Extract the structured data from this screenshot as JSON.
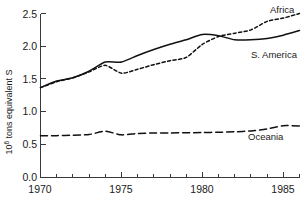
{
  "chart_data": {
    "type": "line",
    "title": "",
    "xlabel": "",
    "ylabel": "10⁶ tons equivalent S",
    "ylabel_base": "10",
    "ylabel_exp": "6",
    "ylabel_rest": " tons equivalent S",
    "xlim": [
      1970,
      1986
    ],
    "ylim": [
      0.0,
      2.5
    ],
    "grid": false,
    "legend_position": "right-inline",
    "x_ticks_major": [
      1970,
      1975,
      1980,
      1985
    ],
    "x_tick_labels": [
      "1970",
      "1975",
      "1980",
      "1985"
    ],
    "x_ticks_minor": [
      1971,
      1972,
      1973,
      1974,
      1976,
      1977,
      1978,
      1979,
      1981,
      1982,
      1983,
      1984,
      1986
    ],
    "y_ticks": [
      0.0,
      0.5,
      1.0,
      1.5,
      2.0,
      2.5
    ],
    "y_tick_labels": [
      "0.0",
      "0.5",
      "1.0",
      "1.5",
      "2.0",
      "2.5"
    ],
    "x": [
      1970,
      1971,
      1972,
      1973,
      1974,
      1975,
      1976,
      1977,
      1978,
      1979,
      1980,
      1981,
      1982,
      1983,
      1984,
      1985,
      1986
    ],
    "series": [
      {
        "name": "S. America",
        "style": "solid",
        "color": "#111111",
        "label": "S. America",
        "values": [
          1.37,
          1.47,
          1.52,
          1.62,
          1.76,
          1.76,
          1.86,
          1.95,
          2.03,
          2.1,
          2.18,
          2.16,
          2.1,
          2.1,
          2.12,
          2.17,
          2.24
        ]
      },
      {
        "name": "Africa",
        "style": "dotted",
        "color": "#111111",
        "label": "Africa",
        "values": [
          1.37,
          1.46,
          1.52,
          1.61,
          1.71,
          1.59,
          1.65,
          1.72,
          1.78,
          1.83,
          2.03,
          2.15,
          2.2,
          2.25,
          2.38,
          2.43,
          2.5
        ]
      },
      {
        "name": "Oceania",
        "style": "dashed",
        "color": "#111111",
        "label": "Oceania",
        "values": [
          0.635,
          0.638,
          0.645,
          0.655,
          0.705,
          0.65,
          0.672,
          0.678,
          0.68,
          0.682,
          0.686,
          0.69,
          0.697,
          0.71,
          0.74,
          0.79,
          0.785
        ]
      }
    ],
    "annotations": [
      {
        "text": "Africa",
        "x": 1986,
        "y": 2.56
      },
      {
        "text": "S. America",
        "x": 1986,
        "y": 2.02
      },
      {
        "text": "Oceania",
        "x": 1985.2,
        "y": 0.6
      }
    ],
    "caption": ""
  }
}
